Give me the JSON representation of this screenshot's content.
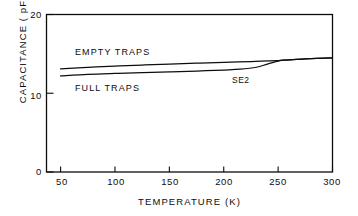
{
  "chart_data": {
    "type": "line",
    "title": "",
    "xlabel": "TEMPERATURE (K)",
    "ylabel": "CAPACITANCE ( pF )",
    "xlim": [
      37.5,
      300
    ],
    "ylim": [
      0,
      20
    ],
    "xticks": [
      50,
      100,
      150,
      200,
      250,
      300
    ],
    "xticklabels": [
      "50",
      "100",
      "150",
      "200",
      "250",
      "300"
    ],
    "yticks": [
      0,
      10,
      20
    ],
    "yticklabels": [
      "0",
      "10",
      "20"
    ],
    "grid": false,
    "legend_position": "inline-annotations",
    "annotations": [
      {
        "text": "EMPTY TRAPS",
        "x": 85,
        "y": 15.6
      },
      {
        "text": "FULL TRAPS",
        "x": 85,
        "y": 11.2
      },
      {
        "text": "SE2",
        "x": 222,
        "y": 11.9
      }
    ],
    "series": [
      {
        "name": "EMPTY TRAPS",
        "x": [
          50,
          75,
          100,
          125,
          150,
          175,
          200,
          225,
          250,
          255,
          275,
          300
        ],
        "y": [
          13.1,
          13.3,
          13.45,
          13.58,
          13.7,
          13.82,
          13.92,
          14.02,
          14.15,
          14.2,
          14.35,
          14.5
        ]
      },
      {
        "name": "FULL TRAPS",
        "x": [
          50,
          75,
          100,
          125,
          150,
          175,
          200,
          215,
          230,
          240,
          250,
          255,
          275,
          300
        ],
        "y": [
          12.2,
          12.4,
          12.52,
          12.62,
          12.72,
          12.82,
          12.95,
          13.05,
          13.3,
          13.7,
          14.08,
          14.2,
          14.35,
          14.5
        ]
      }
    ]
  },
  "axes": {
    "ylabel": "CAPACITANCE ( pF )",
    "xlabel": "TEMPERATURE (K)",
    "yticklabels": [
      "20",
      "10",
      "0"
    ],
    "xticklabels": [
      "50",
      "100",
      "150",
      "200",
      "250",
      "300"
    ]
  },
  "annotations": {
    "empty_traps": "EMPTY TRAPS",
    "full_traps": "FULL TRAPS",
    "se2": "SE2"
  },
  "colors": {
    "ink": "#0d0d0d",
    "background": "#ffffff"
  }
}
